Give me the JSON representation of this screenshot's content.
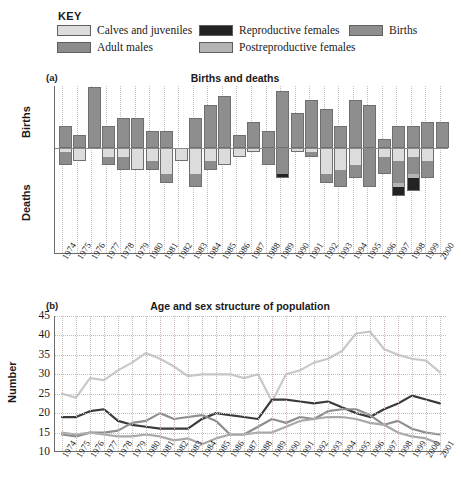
{
  "legend": {
    "title": "KEY",
    "items": [
      {
        "label": "Calves and juveniles",
        "color": "#dcdcdc",
        "name": "calves-and-juveniles"
      },
      {
        "label": "Adult males",
        "color": "#8c8c8c",
        "name": "adult-males"
      },
      {
        "label": "Reproductive females",
        "color": "#232323",
        "name": "reproductive-females"
      },
      {
        "label": "Postreproductive females",
        "color": "#b4b4b4",
        "name": "postreproductive-females"
      },
      {
        "label": "Births",
        "color": "#8e8e8e",
        "name": "births"
      }
    ]
  },
  "panel_a": {
    "tag": "(a)",
    "title": "Births and deaths",
    "ylabel_top": "Births",
    "ylabel_bottom": "Deaths"
  },
  "panel_b": {
    "tag": "(b)",
    "title": "Age and sex structure of population",
    "ylabel": "Number"
  },
  "chart_data": [
    {
      "type": "bar",
      "panel": "(a)",
      "title": "Births and deaths",
      "xlabel": "",
      "ylabel": "Births / Deaths",
      "grid": true,
      "legend_position": "top",
      "note": "Diverging stacked bar: births plotted upward, deaths plotted downward as stacked segments by class",
      "categories": [
        "1974",
        "1975",
        "1976",
        "1977",
        "1978",
        "1979",
        "1980",
        "1981",
        "1982",
        "1983",
        "1984",
        "1985",
        "1986",
        "1987",
        "1988",
        "1989",
        "1990",
        "1991",
        "1992",
        "1993",
        "1994",
        "1995",
        "1996",
        "1997",
        "1998",
        "1999",
        "2000"
      ],
      "births": [
        5,
        3,
        14,
        5,
        7,
        7,
        4,
        4,
        0,
        7,
        10,
        12,
        3,
        6,
        4,
        13,
        8,
        11,
        9,
        5,
        11,
        10,
        2,
        5,
        5,
        6,
        6
      ],
      "deaths_stacked": {
        "categories_order": [
          "Calves and juveniles",
          "Adult males",
          "Postreproductive females",
          "Reproductive females"
        ],
        "values": [
          {
            "year": "1974",
            "calves": 1,
            "males": 3,
            "postrep": 0,
            "reprod": 0
          },
          {
            "year": "1975",
            "calves": 3,
            "males": 0,
            "postrep": 0,
            "reprod": 0
          },
          {
            "year": "1976",
            "calves": 0,
            "males": 0,
            "postrep": 0,
            "reprod": 0
          },
          {
            "year": "1977",
            "calves": 2,
            "males": 2,
            "postrep": 0,
            "reprod": 0
          },
          {
            "year": "1978",
            "calves": 2,
            "males": 3,
            "postrep": 0,
            "reprod": 0
          },
          {
            "year": "1979",
            "calves": 5,
            "males": 0,
            "postrep": 0,
            "reprod": 0
          },
          {
            "year": "1980",
            "calves": 3,
            "males": 2,
            "postrep": 0,
            "reprod": 0
          },
          {
            "year": "1981",
            "calves": 6,
            "males": 2,
            "postrep": 0,
            "reprod": 0
          },
          {
            "year": "1982",
            "calves": 3,
            "males": 0,
            "postrep": 0,
            "reprod": 0
          },
          {
            "year": "1983",
            "calves": 6,
            "males": 3,
            "postrep": 0,
            "reprod": 0
          },
          {
            "year": "1984",
            "calves": 3,
            "males": 2,
            "postrep": 0,
            "reprod": 0
          },
          {
            "year": "1985",
            "calves": 4,
            "males": 0,
            "postrep": 0,
            "reprod": 0
          },
          {
            "year": "1986",
            "calves": 2,
            "males": 0,
            "postrep": 0,
            "reprod": 0
          },
          {
            "year": "1987",
            "calves": 1,
            "males": 0,
            "postrep": 0,
            "reprod": 0
          },
          {
            "year": "1988",
            "calves": 0,
            "males": 4,
            "postrep": 0,
            "reprod": 0
          },
          {
            "year": "1989",
            "calves": 0,
            "males": 6,
            "postrep": 0,
            "reprod": 1
          },
          {
            "year": "1990",
            "calves": 1,
            "males": 0,
            "postrep": 0,
            "reprod": 0
          },
          {
            "year": "1991",
            "calves": 1,
            "males": 1,
            "postrep": 0,
            "reprod": 0
          },
          {
            "year": "1992",
            "calves": 6,
            "males": 2,
            "postrep": 0,
            "reprod": 0
          },
          {
            "year": "1993",
            "calves": 5,
            "males": 4,
            "postrep": 0,
            "reprod": 0
          },
          {
            "year": "1994",
            "calves": 4,
            "males": 3,
            "postrep": 0,
            "reprod": 0
          },
          {
            "year": "1995",
            "calves": 0,
            "males": 9,
            "postrep": 0,
            "reprod": 0
          },
          {
            "year": "1996",
            "calves": 2,
            "males": 4,
            "postrep": 0,
            "reprod": 0
          },
          {
            "year": "1997",
            "calves": 3,
            "males": 5,
            "postrep": 1,
            "reprod": 2
          },
          {
            "year": "1998",
            "calves": 2,
            "males": 4,
            "postrep": 1,
            "reprod": 3
          },
          {
            "year": "1999",
            "calves": 3,
            "males": 4,
            "postrep": 0,
            "reprod": 0
          },
          {
            "year": "2000",
            "calves": 0,
            "males": 0,
            "postrep": 0,
            "reprod": 0
          }
        ]
      }
    },
    {
      "type": "line",
      "panel": "(b)",
      "title": "Age and sex structure of population",
      "xlabel": "",
      "ylabel": "Number",
      "ylim": [
        10,
        45
      ],
      "yticks": [
        10,
        15,
        20,
        25,
        30,
        35,
        40,
        45
      ],
      "grid": true,
      "legend_position": "top",
      "x": [
        "1974",
        "1975",
        "1976",
        "1977",
        "1978",
        "1979",
        "1980",
        "1981",
        "1982",
        "1983",
        "1984",
        "1985",
        "1986",
        "1987",
        "1988",
        "1989",
        "1990",
        "1991",
        "1992",
        "1993",
        "1994",
        "1995",
        "1996",
        "1997",
        "1998",
        "1999",
        "2000",
        "2001"
      ],
      "series": [
        {
          "name": "Calves and juveniles",
          "color": "#c8c8c8",
          "values": [
            25,
            24,
            29,
            28.5,
            31,
            33,
            35.5,
            34,
            32,
            29.5,
            30,
            30,
            30,
            29,
            30,
            23,
            30,
            31,
            33,
            34,
            36,
            40.5,
            41,
            36.5,
            35,
            34,
            33.5,
            30.5
          ]
        },
        {
          "name": "Reproductive females",
          "color": "#3a3a3a",
          "values": [
            19,
            19,
            20.5,
            21,
            18,
            17,
            16.5,
            16,
            16,
            16,
            18.5,
            20,
            19.5,
            19,
            18.5,
            23.5,
            23.5,
            23,
            22.5,
            23,
            21.5,
            20,
            19,
            21,
            22.5,
            24.5,
            23.5,
            22.5
          ]
        },
        {
          "name": "Adult males",
          "color": "#8e8e8e",
          "values": [
            14.5,
            14,
            15,
            15,
            15.5,
            17.5,
            18,
            20,
            18.5,
            19,
            19.5,
            18,
            14.5,
            14.5,
            16.5,
            18.5,
            17.5,
            19,
            18.5,
            20.5,
            21,
            21,
            19.5,
            17,
            18,
            16,
            15,
            14.5
          ]
        },
        {
          "name": "Postreproductive females",
          "color": "#a8a8a8",
          "values": [
            15,
            14.5,
            15,
            14.5,
            14,
            14,
            14.5,
            14,
            13,
            13.5,
            12,
            13.5,
            14.5,
            14.5,
            15,
            15,
            16.5,
            18,
            18.5,
            19,
            19,
            18.5,
            17.5,
            17,
            15,
            14,
            13.5,
            12
          ]
        }
      ]
    }
  ]
}
